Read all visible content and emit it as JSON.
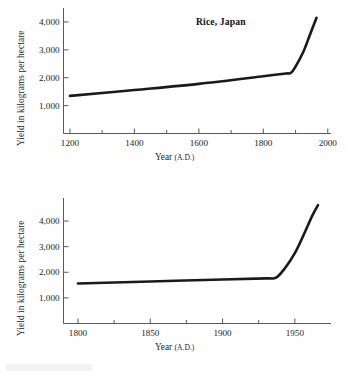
{
  "page": {
    "background_color": "#fefefe",
    "ink_color": "#1a1a1a",
    "axis_color": "#5a5a5a"
  },
  "chart_data": [
    {
      "id": "rice-japan",
      "type": "line",
      "title": "Rice, Japan",
      "xlabel_main": "Year",
      "xlabel_paren": "(A.D.)",
      "ylabel": "Yield in kilograms per hectare",
      "xlim": [
        1180,
        2010
      ],
      "ylim": [
        0,
        4500
      ],
      "xticks": [
        1200,
        1400,
        1600,
        1800,
        2000
      ],
      "xtick_labels": [
        "1200",
        "1400",
        "1600",
        "1800",
        "2000"
      ],
      "xminor_ticks": [
        1300,
        1500,
        1700,
        1900
      ],
      "yticks": [
        1000,
        2000,
        3000,
        4000
      ],
      "ytick_labels": [
        "1,000",
        "2,000",
        "3,000",
        "4,000"
      ],
      "grid": false,
      "legend": "none",
      "x": [
        1200,
        1400,
        1600,
        1800,
        1870,
        1885,
        1900,
        1925,
        1945,
        1965
      ],
      "values": [
        1350,
        1560,
        1780,
        2050,
        2150,
        2170,
        2400,
        2950,
        3550,
        4150
      ]
    },
    {
      "id": "corn-usa",
      "type": "line",
      "title": "Corn, U.S.A.",
      "xlabel_main": "Year",
      "xlabel_paren": "(A.D.)",
      "ylabel": "Yield in kilograms per hectare",
      "xlim": [
        1790,
        1975
      ],
      "ylim": [
        0,
        4900
      ],
      "xticks": [
        1800,
        1850,
        1900,
        1950
      ],
      "xtick_labels": [
        "1800",
        "1850",
        "1900",
        "1950"
      ],
      "xminor_ticks": [
        1825,
        1875,
        1925
      ],
      "yticks": [
        1000,
        2000,
        3000,
        4000
      ],
      "ytick_labels": [
        "1,000",
        "2,000",
        "3,000",
        "4,000"
      ],
      "grid": false,
      "legend": "none",
      "x": [
        1800,
        1850,
        1900,
        1930,
        1937,
        1943,
        1950,
        1956,
        1962,
        1966
      ],
      "values": [
        1560,
        1640,
        1720,
        1760,
        1790,
        2150,
        2750,
        3450,
        4200,
        4620
      ]
    }
  ]
}
